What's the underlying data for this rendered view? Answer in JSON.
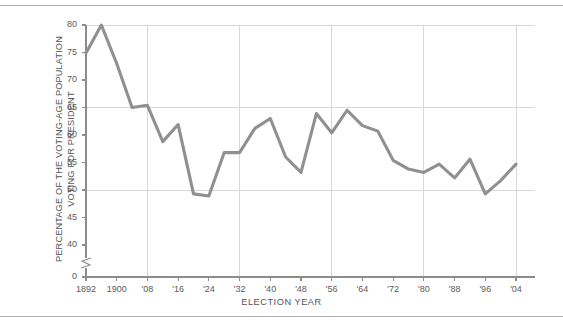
{
  "figure": {
    "background_color": "#ffffff",
    "rule_color": "#b0b0b0",
    "top_rule_name": "top-divider",
    "bottom_rule_name": "bottom-divider"
  },
  "chart_data": {
    "type": "line",
    "title": "",
    "xlabel": "ELECTION YEAR",
    "ylabel": "PERCENTAGE OF THE VOTING-AGE POPULATION VOTING FOR PRESIDENT",
    "ylabel_line1": "PERCENTAGE OF THE VOTING-AGE POPULATION",
    "ylabel_line2": "VOTING FOR PRESIDENT",
    "line_color": "#909090",
    "grid_color": "#d8d8d8",
    "axis_color": "#8c8c8c",
    "grid": "major x every 24 years, major y at 50/65/80",
    "legend": "none",
    "axis_break": true,
    "axis_break_note": "y-axis broken between 0 and 40",
    "ylim": [
      38,
      81
    ],
    "yticks": [
      80,
      75,
      70,
      65,
      60,
      55,
      50,
      45,
      40,
      0
    ],
    "ytick_labels": [
      "80",
      "75",
      "70",
      "65",
      "60",
      "55",
      "50",
      "45",
      "40",
      "0"
    ],
    "y_gridlines": [
      80,
      65,
      50
    ],
    "xticks": [
      1892,
      1900,
      1908,
      1916,
      1924,
      1932,
      1940,
      1948,
      1956,
      1964,
      1972,
      1980,
      1988,
      1996,
      2004
    ],
    "xtick_labels": [
      "1892",
      "1900",
      "'08",
      "'16",
      "'24",
      "'32",
      "'40",
      "'48",
      "'56",
      "'64",
      "'72",
      "'80",
      "'88",
      "'96",
      "'04"
    ],
    "x_gridlines": [
      1908,
      1932,
      1956,
      1980,
      2004
    ],
    "x": [
      1892,
      1896,
      1900,
      1904,
      1908,
      1912,
      1916,
      1920,
      1924,
      1928,
      1932,
      1936,
      1940,
      1944,
      1948,
      1952,
      1956,
      1960,
      1964,
      1968,
      1972,
      1976,
      1980,
      1984,
      1988,
      1992,
      1996,
      2000,
      2004
    ],
    "values": [
      74.9,
      80.0,
      73.0,
      65.0,
      65.4,
      58.8,
      61.9,
      49.3,
      48.9,
      56.8,
      56.8,
      61.2,
      63.0,
      56.0,
      53.2,
      63.9,
      60.4,
      64.5,
      61.7,
      60.7,
      55.4,
      53.8,
      53.2,
      54.7,
      52.2,
      55.6,
      49.3,
      51.7,
      54.7
    ],
    "series": [
      {
        "name": "Voter turnout",
        "values": [
          74.9,
          80.0,
          73.0,
          65.0,
          65.4,
          58.8,
          61.9,
          49.3,
          48.9,
          56.8,
          56.8,
          61.2,
          63.0,
          56.0,
          53.2,
          63.9,
          60.4,
          64.5,
          61.7,
          60.7,
          55.4,
          53.8,
          53.2,
          54.7,
          52.2,
          55.6,
          49.3,
          51.7,
          54.7
        ]
      }
    ]
  }
}
